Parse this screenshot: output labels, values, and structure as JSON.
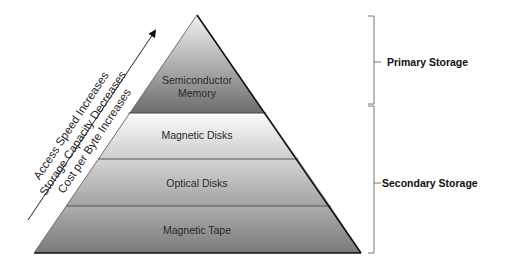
{
  "levels": [
    {
      "label_line1": "Semiconductor",
      "label_line2": "Memory",
      "fill_top": "#c8c8c8",
      "fill_bottom": "#6e6e6e"
    },
    {
      "label": "Magnetic Disks",
      "fill_top": "#fafafa",
      "fill_bottom": "#c9c9c9"
    },
    {
      "label": "Optical Disks",
      "fill_top": "#d6d6d6",
      "fill_bottom": "#a5a5a5"
    },
    {
      "label": "Magnetic Tape",
      "fill_top": "#b2b2b2",
      "fill_bottom": "#7c7c7c"
    }
  ],
  "arrow_labels": [
    "Access Speed Increases",
    "Storage Capacity Decreases",
    "Cost per Byte Increases"
  ],
  "groups": {
    "primary": "Primary Storage",
    "secondary": "Secondary Storage"
  },
  "colors": {
    "outline": "#111111",
    "band_line": "#555555",
    "bracket": "#777777"
  }
}
